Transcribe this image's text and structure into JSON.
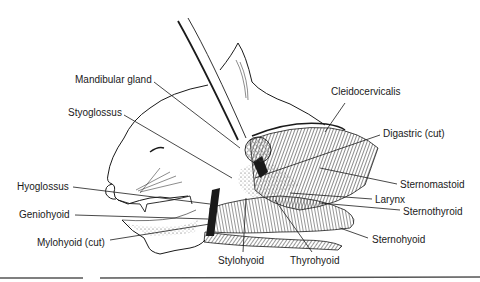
{
  "diagram": {
    "colors": {
      "ink": "#1a1a1a",
      "background": "#ffffff",
      "stipple": "#d9d9d9",
      "rule": "#555555"
    },
    "labels": [
      {
        "id": "mandibular-gland",
        "text": "Mandibular gland",
        "x": 75,
        "y": 74,
        "anchor": [
          154,
          82
        ],
        "target": [
          240,
          148
        ]
      },
      {
        "id": "styoglossus",
        "text": "Styoglossus",
        "x": 68,
        "y": 107,
        "anchor": [
          124,
          115
        ],
        "target": [
          232,
          178
        ]
      },
      {
        "id": "cleidocervicalis",
        "text": "Cleidocervicalis",
        "x": 331,
        "y": 86,
        "anchor": [
          345,
          103
        ],
        "target": [
          325,
          132
        ]
      },
      {
        "id": "digastric-cut",
        "text": "Digastric (cut)",
        "x": 383,
        "y": 128,
        "anchor": [
          380,
          135
        ],
        "target": [
          255,
          178
        ]
      },
      {
        "id": "hyoglossus",
        "text": "Hyoglossus",
        "x": 17,
        "y": 181,
        "anchor": [
          73,
          187
        ],
        "target": [
          210,
          204
        ]
      },
      {
        "id": "geniohyoid",
        "text": "Geniohyoid",
        "x": 19,
        "y": 209,
        "anchor": [
          75,
          215
        ],
        "target": [
          208,
          219
        ]
      },
      {
        "id": "mylohyoid-cut",
        "text": "Mylohyoid (cut)",
        "x": 37,
        "y": 237,
        "anchor": [
          110,
          240
        ],
        "target": [
          210,
          224
        ]
      },
      {
        "id": "sternomastoid",
        "text": "Sternomastoid",
        "x": 400,
        "y": 179,
        "anchor": [
          397,
          184
        ],
        "target": [
          320,
          168
        ]
      },
      {
        "id": "larynx",
        "text": "Larynx",
        "x": 375,
        "y": 194,
        "anchor": [
          372,
          199
        ],
        "target": [
          290,
          193
        ]
      },
      {
        "id": "sternothyroid",
        "text": "Sternothyroid",
        "x": 403,
        "y": 206,
        "anchor": [
          400,
          210
        ],
        "target": [
          320,
          203
        ]
      },
      {
        "id": "sternohyoid",
        "text": "Sternohyoid",
        "x": 372,
        "y": 234,
        "anchor": [
          368,
          238
        ],
        "target": [
          340,
          228
        ]
      },
      {
        "id": "stylohyoid",
        "text": "Stylohyoid",
        "x": 218,
        "y": 255,
        "anchor": [
          243,
          252
        ],
        "target": [
          246,
          198
        ]
      },
      {
        "id": "thyrohyoid",
        "text": "Thyrohyoid",
        "x": 290,
        "y": 255,
        "anchor": [
          312,
          252
        ],
        "target": [
          275,
          200
        ]
      }
    ],
    "bottom_rules": [
      {
        "x1": 0,
        "y1": 278,
        "x2": 83,
        "y2": 278
      },
      {
        "x1": 100,
        "y1": 278,
        "x2": 480,
        "y2": 277
      }
    ]
  }
}
